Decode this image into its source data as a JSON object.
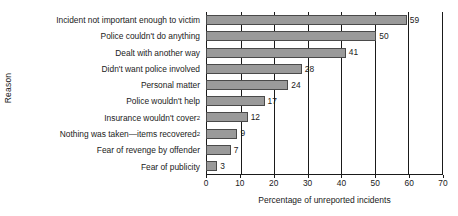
{
  "chart_data": {
    "type": "bar",
    "orientation": "horizontal",
    "title": "",
    "xlabel": "Percentage of unreported incidents",
    "ylabel": "Reason",
    "xlim": [
      0,
      70
    ],
    "xticks": [
      0,
      10,
      20,
      30,
      40,
      50,
      60,
      70
    ],
    "grid": true,
    "legend": false,
    "bar_color": "#9a9a9a",
    "bar_edge_color": "#4a4a4a",
    "categories": [
      "Incident not important enough to victim",
      "Police couldn't do anything",
      "Dealt with another way",
      "Didn't want police involved",
      "Personal matter",
      "Police wouldn't help",
      "Insurance wouldn't cover",
      "Nothing was taken—items recovered",
      "Fear of revenge by offender",
      "Fear of publicity"
    ],
    "category_footnotes": [
      "",
      "",
      "",
      "",
      "",
      "",
      "2",
      "2",
      "",
      ""
    ],
    "values": [
      59,
      50,
      41,
      28,
      24,
      17,
      12,
      9,
      7,
      3
    ],
    "value_labels": [
      "59",
      "50",
      "41",
      "28",
      "24",
      "17",
      "12",
      "9",
      "7",
      "3"
    ]
  }
}
